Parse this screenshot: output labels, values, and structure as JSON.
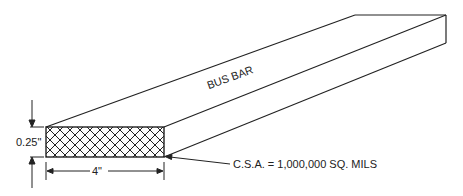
{
  "diagram": {
    "title_label": "BUS BAR",
    "thickness_label": "0.25\"",
    "width_label": "4\"",
    "csa_label": "C.S.A. = 1,000,000 SQ. MILS"
  },
  "colors": {
    "line": "#222222",
    "background": "#ffffff"
  }
}
